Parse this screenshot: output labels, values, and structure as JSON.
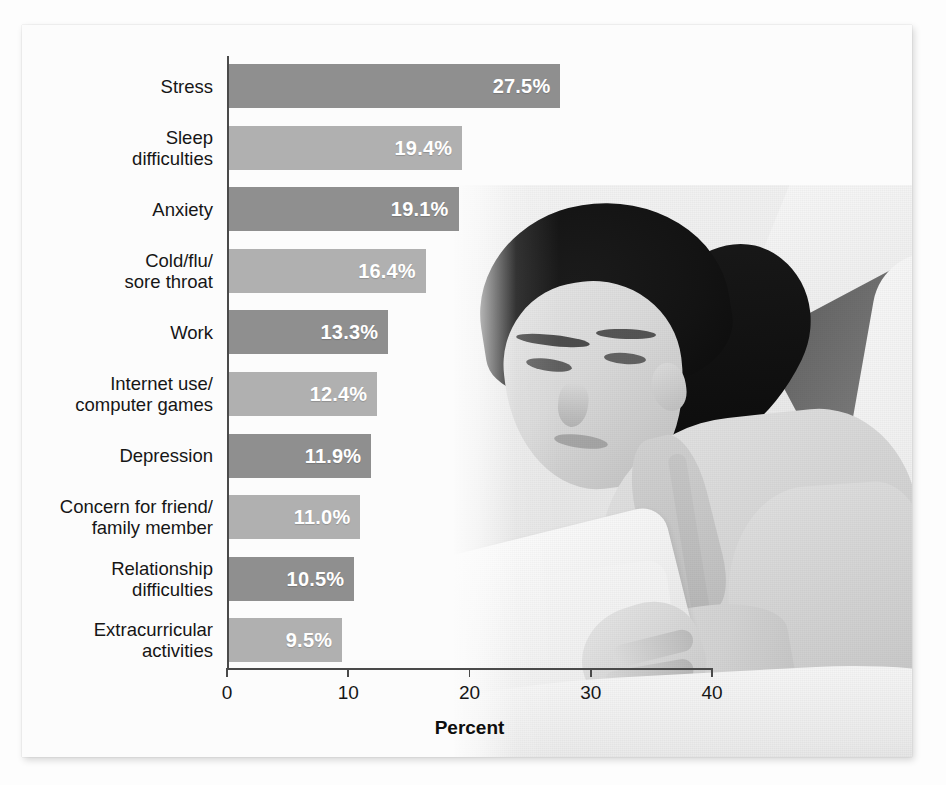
{
  "figure": {
    "background_color": "#fdfdfd",
    "panel_color": "#fcfcfc"
  },
  "photo": {
    "alt": "grayscale photograph of a young woman lying down reading an open book on a bed"
  },
  "chart_data": {
    "type": "bar",
    "orientation": "horizontal",
    "title": "",
    "xlabel": "Percent",
    "ylabel": "",
    "xlim": [
      0,
      40
    ],
    "xticks": [
      0,
      10,
      20,
      30,
      40
    ],
    "xticklabels": [
      "0",
      "10",
      "20",
      "30",
      "40"
    ],
    "grid": false,
    "legend": "none",
    "bar_colors": [
      "#8f8f8f",
      "#b0b0b0"
    ],
    "value_label_color": "#ffffff",
    "categories": [
      "Stress",
      "Sleep\ndifficulties",
      "Anxiety",
      "Cold/flu/\nsore throat",
      "Work",
      "Internet use/\ncomputer games",
      "Depression",
      "Concern for friend/\nfamily member",
      "Relationship\ndifficulties",
      "Extracurricular\nactivities"
    ],
    "values": [
      27.5,
      19.4,
      19.1,
      16.4,
      13.3,
      12.4,
      11.9,
      11.0,
      10.5,
      9.5
    ],
    "value_labels": [
      "27.5%",
      "19.4%",
      "19.1%",
      "16.4%",
      "13.3%",
      "12.4%",
      "11.9%",
      "11.0%",
      "10.5%",
      "9.5%"
    ]
  }
}
